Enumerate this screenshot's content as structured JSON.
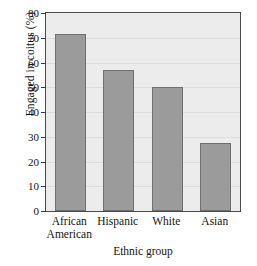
{
  "chart_data": {
    "type": "bar",
    "title": "",
    "xlabel": "Ethnic group",
    "ylabel": "Engaged in coitus (%)",
    "categories": [
      "African American",
      "Hispanic",
      "White",
      "Asian"
    ],
    "category_lines": [
      [
        "African",
        "American"
      ],
      [
        "Hispanic",
        ""
      ],
      [
        "White",
        ""
      ],
      [
        "Asian",
        ""
      ]
    ],
    "values": [
      71.5,
      57,
      50,
      27.5
    ],
    "ylim": [
      0,
      80
    ],
    "yticks": [
      0,
      10,
      20,
      30,
      40,
      50,
      60,
      70,
      80
    ],
    "ytick_labels": [
      "0",
      "10",
      "20",
      "30",
      "40",
      "50",
      "60",
      "70",
      "80"
    ],
    "grid": true,
    "legend": "none",
    "bar_color": "#9b9b9b",
    "bar_edge_color": "#6f6f6f",
    "plot_background": "#ececec",
    "axis_color": "#4a4a4a"
  }
}
